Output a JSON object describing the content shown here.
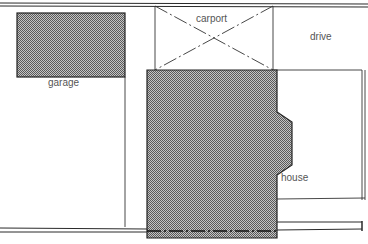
{
  "diagram": {
    "type": "site-plan",
    "labels": {
      "garage": "garage",
      "carport": "carport",
      "drive": "drive",
      "house": "house"
    },
    "colors": {
      "line": "#2a2a2a",
      "hatch_dark": "#5a5a5a",
      "hatch_light": "#c8c8c8",
      "label": "#555555",
      "background": "#ffffff"
    },
    "elements": [
      {
        "name": "garage",
        "shape": "hatched-rectangle"
      },
      {
        "name": "carport",
        "shape": "rectangle-with-dashed-x"
      },
      {
        "name": "drive",
        "shape": "open-area"
      },
      {
        "name": "house",
        "shape": "hatched-polygon"
      },
      {
        "name": "street-top",
        "shape": "double-line"
      },
      {
        "name": "street-bottom",
        "shape": "double-line-with-dash-dot"
      }
    ]
  }
}
